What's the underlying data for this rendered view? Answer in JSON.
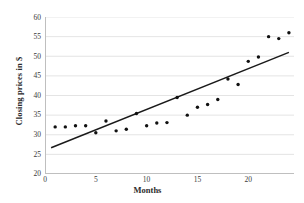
{
  "chart_data": {
    "type": "scatter",
    "title": "",
    "xlabel": "Months",
    "ylabel": "Closing prices in $",
    "xlim": [
      0,
      24.5
    ],
    "ylim": [
      20,
      60
    ],
    "xticks": [
      0,
      5,
      10,
      15,
      20
    ],
    "yticks": [
      20,
      25,
      30,
      35,
      40,
      45,
      50,
      55,
      60
    ],
    "grid": "horizontal",
    "legend": "none",
    "marker_color": "#111111",
    "trendline_color": "#1a1a1a",
    "gridline_color": "#d9d9d9",
    "axis_color": "#bfbfbf",
    "x": [
      1,
      2,
      3,
      4,
      5,
      6,
      7,
      8,
      9,
      10,
      11,
      12,
      13,
      14,
      15,
      16,
      17,
      18,
      19,
      20,
      21,
      22,
      23,
      24
    ],
    "values": [
      32.0,
      32.0,
      32.3,
      32.3,
      30.5,
      33.5,
      31.0,
      31.4,
      35.4,
      32.3,
      33.0,
      33.1,
      39.5,
      35.0,
      37.0,
      37.7,
      39.0,
      44.2,
      42.8,
      48.7,
      49.8,
      55.0,
      54.5,
      56.0
    ],
    "series": [
      {
        "name": "Closing price",
        "values": [
          32.0,
          32.0,
          32.3,
          32.3,
          30.5,
          33.5,
          31.0,
          31.4,
          35.4,
          32.3,
          33.0,
          33.1,
          39.5,
          35.0,
          37.0,
          37.7,
          39.0,
          44.2,
          42.8,
          48.7,
          49.8,
          55.0,
          54.5,
          56.0
        ]
      }
    ],
    "trendline": {
      "name": "linear trend",
      "x0": 0.6,
      "y0": 26.7,
      "x1": 24.0,
      "y1": 51.0
    }
  },
  "axes": {
    "y_title": "Closing prices in $",
    "x_title": "Months",
    "y_tick_labels": [
      "60",
      "55",
      "50",
      "45",
      "40",
      "35",
      "30",
      "25",
      "20"
    ],
    "x_tick_labels": [
      "0",
      "5",
      "10",
      "15",
      "20"
    ]
  }
}
